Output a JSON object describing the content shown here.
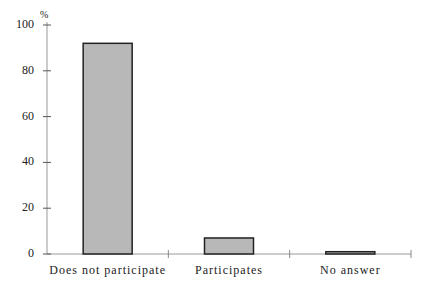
{
  "chart_data": {
    "type": "bar",
    "title": "",
    "xlabel": "",
    "ylabel": "%",
    "categories": [
      "Does not participate",
      "Participates",
      "No answer"
    ],
    "values": [
      92,
      7,
      1
    ],
    "ylim": [
      0,
      100
    ],
    "yticks": [
      0,
      20,
      40,
      60,
      80,
      100
    ],
    "grid": false,
    "legend": null,
    "colors": {
      "bar_fill": "#b8b8b8",
      "bar_stroke": "#222222",
      "axis": "#999999"
    }
  }
}
